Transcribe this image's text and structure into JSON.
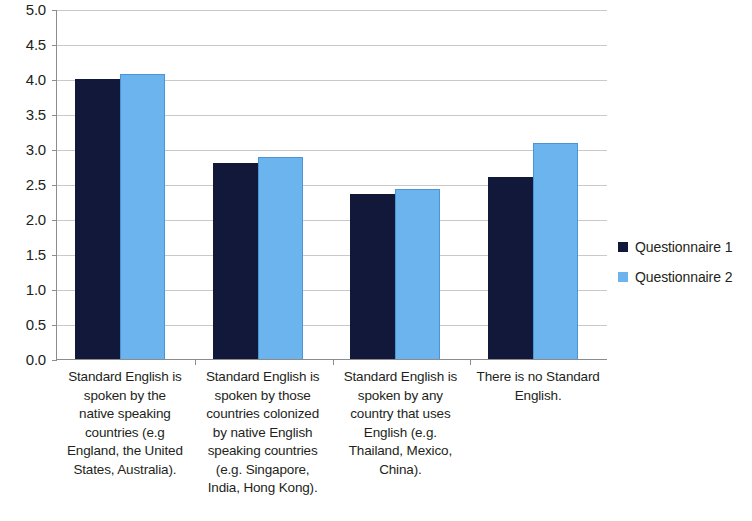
{
  "chart_data": {
    "type": "bar",
    "title": "",
    "xlabel": "",
    "ylabel": "",
    "ylim": [
      0.0,
      5.0
    ],
    "ytick_step": 0.5,
    "grid": true,
    "legend_position": "right",
    "categories": [
      "Standard English is spoken by the native speaking countries (e.g England, the United States, Australia).",
      "Standard English is spoken by those countries colonized by native English speaking countries (e.g. Singapore, India, Hong Kong).",
      "Standard English is spoken by any country that uses English (e.g. Thailand, Mexico, China).",
      "There is no Standard English."
    ],
    "category_lines": [
      [
        "Standard English is",
        "spoken by the",
        "native speaking",
        "countries (e.g",
        "England, the United",
        "States, Australia)."
      ],
      [
        "Standard English is",
        "spoken by those",
        "countries colonized",
        "by native English",
        "speaking countries",
        "(e.g. Singapore,",
        "India, Hong Kong)."
      ],
      [
        "Standard English is",
        "spoken by any",
        "country that uses",
        "English (e.g.",
        "Thailand, Mexico,",
        "China)."
      ],
      [
        "There is no Standard",
        "English."
      ]
    ],
    "ytick_labels": [
      "5.0",
      "4.5",
      "4.0",
      "3.5",
      "3.0",
      "2.5",
      "2.0",
      "1.5",
      "1.0",
      "0.5",
      "0.0"
    ],
    "ytick_values": [
      5.0,
      4.5,
      4.0,
      3.5,
      3.0,
      2.5,
      2.0,
      1.5,
      1.0,
      0.5,
      0.0
    ],
    "series": [
      {
        "name": "Questionnaire 1",
        "color": "#12183A",
        "values": [
          4.0,
          2.8,
          2.36,
          2.6
        ]
      },
      {
        "name": "Questionnaire 2",
        "color": "#6CB4EE",
        "values": [
          4.07,
          2.89,
          2.43,
          3.08
        ]
      }
    ]
  },
  "legend": {
    "items": [
      {
        "label": "Questionnaire 1",
        "color": "#12183A"
      },
      {
        "label": "Questionnaire 2",
        "color": "#6CB4EE"
      }
    ]
  },
  "colors": {
    "series_1": "#12183A",
    "series_2": "#6CB4EE",
    "gridline": "#C9C9C9",
    "axis": "#8C8C8C",
    "text": "#231F20",
    "background": "#FFFFFF"
  }
}
